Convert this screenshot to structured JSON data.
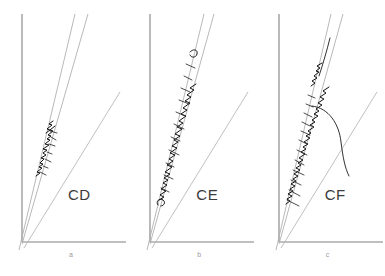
{
  "figure": {
    "background_color": "#ffffff",
    "width": 385,
    "height": 276,
    "panel_count": 3
  },
  "colors": {
    "axis": "#808080",
    "guide_line": "#b9b9b9",
    "trace": "#111111",
    "panel_code_text": "#3a3a3a",
    "sub_label_text": "#9a9a9a"
  },
  "panels": [
    {
      "code": "CD",
      "sub_label": "a",
      "axes": {
        "y_axis_label": "",
        "x_axis_label": ""
      },
      "guide_lines": [
        {
          "name": "upper-envelope",
          "from": [
            22,
            242
          ],
          "to": [
            75,
            14
          ]
        },
        {
          "name": "lower-envelope",
          "from": [
            22,
            242
          ],
          "to": [
            88,
            14
          ]
        },
        {
          "name": "shallow-reference",
          "from": [
            22,
            242
          ],
          "to": [
            120,
            92
          ]
        }
      ],
      "trace": {
        "name": "load-displacement-trace",
        "extent_start": [
          38,
          170
        ],
        "extent_end": [
          47,
          128
        ],
        "description": "short dense zigzag segment confined between the two steep envelope lines"
      }
    },
    {
      "code": "CE",
      "sub_label": "b",
      "axes": {
        "y_axis_label": "",
        "x_axis_label": ""
      },
      "guide_lines": [
        {
          "name": "upper-envelope",
          "from": [
            22,
            242
          ],
          "to": [
            76,
            14
          ]
        },
        {
          "name": "lower-envelope",
          "from": [
            22,
            242
          ],
          "to": [
            86,
            14
          ]
        },
        {
          "name": "shallow-reference",
          "from": [
            22,
            242
          ],
          "to": [
            120,
            92
          ]
        }
      ],
      "trace": {
        "name": "load-displacement-trace",
        "extent_start": [
          32,
          196
        ],
        "extent_end": [
          72,
          44
        ],
        "description": "long sawtooth zigzag trace with repeated serrations tracking the steep envelope"
      }
    },
    {
      "code": "CF",
      "sub_label": "c",
      "axes": {
        "y_axis_label": "",
        "x_axis_label": ""
      },
      "guide_lines": [
        {
          "name": "upper-envelope",
          "from": [
            22,
            242
          ],
          "to": [
            74,
            14
          ]
        },
        {
          "name": "lower-envelope",
          "from": [
            22,
            242
          ],
          "to": [
            86,
            14
          ]
        },
        {
          "name": "shallow-reference",
          "from": [
            22,
            242
          ],
          "to": [
            120,
            92
          ]
        }
      ],
      "trace": {
        "name": "load-displacement-trace",
        "extent_start": [
          30,
          200
        ],
        "extent_end": [
          62,
          80
        ],
        "description": "dense serrated zigzag with many rightward spikes plus a large unloading arc curving to the right"
      },
      "arc": {
        "name": "unloading-arc",
        "from": [
          55,
          108
        ],
        "to": [
          92,
          176
        ],
        "description": "smooth arc bowing to the right from the trace down toward the shallow reference line"
      }
    }
  ]
}
